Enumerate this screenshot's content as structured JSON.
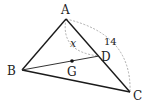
{
  "diagram": {
    "type": "geometry-triangle",
    "points": {
      "A": {
        "label": "A",
        "x": 66,
        "y": 19
      },
      "B": {
        "label": "B",
        "x": 22,
        "y": 70
      },
      "C": {
        "label": "C",
        "x": 130,
        "y": 92
      },
      "D": {
        "label": "D",
        "x": 99,
        "y": 56
      },
      "G": {
        "label": "G",
        "x": 72,
        "y": 61
      }
    },
    "segments": [
      "AB",
      "AC",
      "BC",
      "BD"
    ],
    "measures": {
      "AD": "x",
      "AC": "14"
    },
    "labels": {
      "A": "A",
      "B": "B",
      "C": "C",
      "D": "D",
      "G": "G",
      "x": "x",
      "length_AC": "14"
    },
    "colors": {
      "line": "#1a1a1a",
      "dashed": "#999999",
      "background": "#ffffff"
    }
  }
}
